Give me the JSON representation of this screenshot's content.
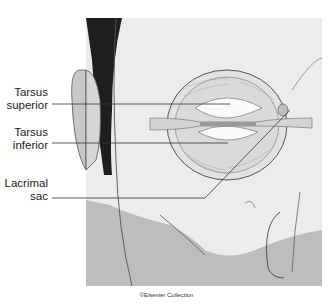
{
  "labels": [
    {
      "id": "tarsus-superior",
      "line1": "Tarsus",
      "line2": "superior"
    },
    {
      "id": "tarsus-inferior",
      "line1": "Tarsus",
      "line2": "inferior"
    },
    {
      "id": "lacrimal-sac",
      "line1": "Lacrimal",
      "line2": "sac"
    }
  ],
  "credit": "©Elsevier Collection",
  "colors": {
    "skin_light": "#efefef",
    "skin_shade": "#b9b9b9",
    "hair": "#1e1e1e",
    "line": "#555555"
  }
}
